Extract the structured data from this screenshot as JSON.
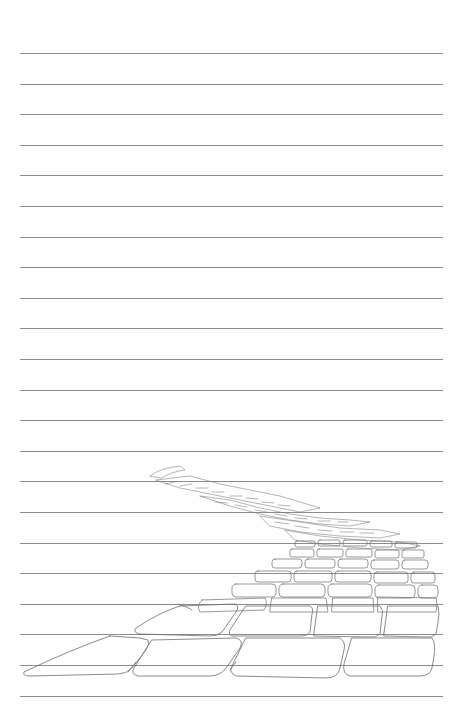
{
  "page": {
    "type": "lined notebook page",
    "background_color": "#fefefe",
    "line_color": "#8d8d8d",
    "line_count": 22,
    "first_line_y": 53,
    "line_spacing": 30.6
  },
  "illustration": {
    "subject": "cobblestone-path-sketch",
    "medium": "pencil",
    "stroke_color": "#6f6f6f"
  }
}
